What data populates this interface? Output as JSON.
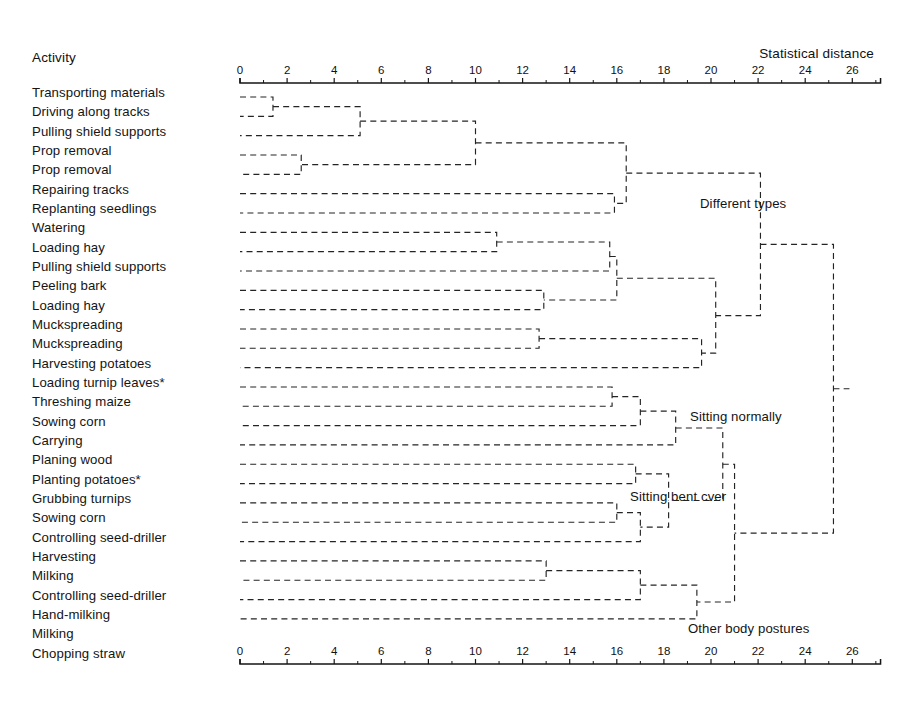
{
  "header": {
    "activity_label": "Activity",
    "distance_label": "Statistical distance"
  },
  "axis": {
    "ticks": [
      0,
      2,
      4,
      6,
      8,
      10,
      12,
      14,
      16,
      18,
      20,
      22,
      24,
      26
    ],
    "minor_step": 1,
    "min": 0,
    "max": 27.2,
    "x_at_zero_px": 240,
    "px_per_unit": 23.55
  },
  "leaves": [
    {
      "index": 0,
      "label": "Transporting materials"
    },
    {
      "index": 1,
      "label": "Driving along tracks"
    },
    {
      "index": 2,
      "label": "Pulling shield supports"
    },
    {
      "index": 3,
      "label": "Prop removal"
    },
    {
      "index": 4,
      "label": "Prop removal"
    },
    {
      "index": 5,
      "label": "Repairing tracks"
    },
    {
      "index": 6,
      "label": "Replanting seedlings"
    },
    {
      "index": 7,
      "label": "Watering"
    },
    {
      "index": 8,
      "label": "Loading hay"
    },
    {
      "index": 9,
      "label": "Pulling shield supports"
    },
    {
      "index": 10,
      "label": "Peeling bark"
    },
    {
      "index": 11,
      "label": "Loading hay"
    },
    {
      "index": 12,
      "label": "Muckspreading"
    },
    {
      "index": 13,
      "label": "Muckspreading"
    },
    {
      "index": 14,
      "label": "Harvesting potatoes"
    },
    {
      "index": 15,
      "label": "Loading turnip leaves*"
    },
    {
      "index": 16,
      "label": "Threshing maize"
    },
    {
      "index": 17,
      "label": "Sowing corn"
    },
    {
      "index": 18,
      "label": "Carrying"
    },
    {
      "index": 19,
      "label": "Planing wood"
    },
    {
      "index": 20,
      "label": "Planting potatoes*"
    },
    {
      "index": 21,
      "label": "Grubbing turnips"
    },
    {
      "index": 22,
      "label": "Sowing corn"
    },
    {
      "index": 23,
      "label": "Controlling seed-driller"
    },
    {
      "index": 24,
      "label": "Harvesting"
    },
    {
      "index": 25,
      "label": "Milking"
    },
    {
      "index": 26,
      "label": "Controlling seed-driller"
    },
    {
      "index": 27,
      "label": "Hand-milking"
    },
    {
      "index": 28,
      "label": "Milking"
    },
    {
      "index": 29,
      "label": "Chopping straw"
    }
  ],
  "cluster_labels": [
    {
      "name": "different-types",
      "text": "Different types",
      "x_px": 700,
      "y_px": 205
    },
    {
      "name": "sitting-normally",
      "text": "Sitting normally",
      "x_px": 690,
      "y_px": 418
    },
    {
      "name": "sitting-bent-over",
      "text": "Sitting bent cver",
      "x_px": 630,
      "y_px": 498
    },
    {
      "name": "other-postures",
      "text": "Other body postures",
      "x_px": 688,
      "y_px": 630
    }
  ],
  "chart_data": {
    "type": "dendrogram",
    "title": "",
    "xlabel": "Statistical distance",
    "ylabel": "Activity",
    "xlim": [
      0,
      27.2
    ],
    "xticks": [
      0,
      2,
      4,
      6,
      8,
      10,
      12,
      14,
      16,
      18,
      20,
      22,
      24,
      26
    ],
    "grid": false,
    "axis_top": true,
    "axis_bottom": true,
    "line_style": "dashed",
    "orientation": "horizontal-right",
    "n_leaves": 30,
    "leaf_order": [
      "Transporting materials",
      "Driving along tracks",
      "Pulling shield supports",
      "Prop removal",
      "Prop removal",
      "Repairing tracks",
      "Replanting seedlings",
      "Watering",
      "Loading hay",
      "Pulling shield supports",
      "Peeling bark",
      "Loading hay",
      "Muckspreading",
      "Muckspreading",
      "Harvesting potatoes",
      "Loading turnip leaves*",
      "Threshing maize",
      "Sowing corn",
      "Carrying",
      "Planing wood",
      "Planting potatoes*",
      "Grubbing turnips",
      "Sowing corn",
      "Controlling seed-driller",
      "Harvesting",
      "Milking",
      "Controlling seed-driller",
      "Hand-milking",
      "Milking",
      "Chopping straw"
    ],
    "annotations": [
      "Different types",
      "Sitting normally",
      "Sitting bent cver",
      "Other body postures"
    ],
    "merges": [
      {
        "id": "m1",
        "left": "leaf:0",
        "right": "leaf:1",
        "distance": 1.4
      },
      {
        "id": "m2",
        "left": "m1",
        "right": "leaf:2",
        "distance": 5.1
      },
      {
        "id": "m3",
        "left": "leaf:3",
        "right": "leaf:4",
        "distance": 2.6
      },
      {
        "id": "m4",
        "left": "m2",
        "right": "m3",
        "distance": 10.0
      },
      {
        "id": "m5",
        "left": "leaf:5",
        "right": "leaf:6",
        "distance": 15.9
      },
      {
        "id": "m6",
        "left": "m4",
        "right": "m5",
        "distance": 16.4
      },
      {
        "id": "m7",
        "left": "leaf:7",
        "right": "leaf:8",
        "distance": 10.9
      },
      {
        "id": "m8",
        "left": "m7",
        "right": "leaf:9",
        "distance": 15.7
      },
      {
        "id": "m9",
        "left": "leaf:10",
        "right": "leaf:11",
        "distance": 12.9
      },
      {
        "id": "m10",
        "left": "m8",
        "right": "m9",
        "distance": 16.0
      },
      {
        "id": "m11",
        "left": "leaf:12",
        "right": "leaf:13",
        "distance": 12.7
      },
      {
        "id": "m12",
        "left": "m11",
        "right": "leaf:14",
        "distance": 19.6
      },
      {
        "id": "m13",
        "left": "m10",
        "right": "m12",
        "distance": 20.2
      },
      {
        "id": "m14",
        "left": "m6",
        "right": "m13",
        "distance": 22.1
      },
      {
        "id": "m15",
        "left": "leaf:15",
        "right": "leaf:16",
        "distance": 15.8
      },
      {
        "id": "m16",
        "left": "m15",
        "right": "leaf:17",
        "distance": 17.0
      },
      {
        "id": "m17",
        "left": "m16",
        "right": "leaf:18",
        "distance": 18.5
      },
      {
        "id": "m18",
        "left": "leaf:19",
        "right": "leaf:20",
        "distance": 16.8
      },
      {
        "id": "m19",
        "left": "leaf:21",
        "right": "leaf:22",
        "distance": 16.0
      },
      {
        "id": "m20",
        "left": "m19",
        "right": "leaf:23",
        "distance": 17.0
      },
      {
        "id": "m21",
        "left": "m18",
        "right": "m20",
        "distance": 18.2
      },
      {
        "id": "m22",
        "left": "m17",
        "right": "m21",
        "distance": 20.5
      },
      {
        "id": "m23",
        "left": "leaf:24",
        "right": "leaf:25",
        "distance": 13.0
      },
      {
        "id": "m24",
        "left": "m23",
        "right": "leaf:26",
        "distance": 17.0
      },
      {
        "id": "m25",
        "left": "m24",
        "right": "leaf:27",
        "distance": 19.4
      },
      {
        "id": "m26",
        "left": "m22",
        "right": "m25",
        "distance": 21.0
      },
      {
        "id": "m27",
        "left": "m14",
        "right": "m26",
        "distance": 25.2
      }
    ]
  }
}
